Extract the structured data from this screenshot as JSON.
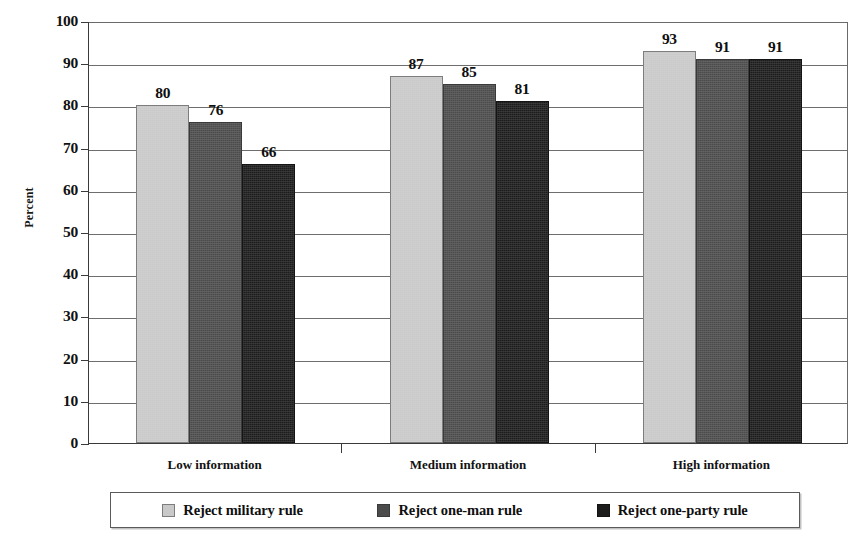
{
  "chart_data": {
    "type": "bar",
    "title": "",
    "xlabel": "",
    "ylabel": "Percent",
    "ylim": [
      0,
      100
    ],
    "ytick_step": 10,
    "yticks": [
      "0",
      "10",
      "20",
      "30",
      "40",
      "50",
      "60",
      "70",
      "80",
      "90",
      "100"
    ],
    "grid": true,
    "legend_position": "bottom",
    "categories": [
      "Low information",
      "Medium information",
      "High information"
    ],
    "series": [
      {
        "name": "Reject military rule",
        "color": "#c9c9c9",
        "values": [
          80,
          87,
          93
        ]
      },
      {
        "name": "Reject one-man rule",
        "color": "#4b4b4b",
        "values": [
          76,
          85,
          91
        ]
      },
      {
        "name": "Reject one-party rule",
        "color": "#1c1c1c",
        "values": [
          66,
          81,
          91
        ]
      }
    ]
  },
  "axis": {
    "y_title": "Percent"
  },
  "legend": {
    "items": [
      {
        "label": "Reject military rule",
        "swatch": "s0"
      },
      {
        "label": "Reject one-man rule",
        "swatch": "s1"
      },
      {
        "label": "Reject one-party rule",
        "swatch": "s2"
      }
    ]
  },
  "colors": {
    "series_light": "#c9c9c9",
    "series_medium": "#4b4b4b",
    "series_dark": "#1c1c1c",
    "axis": "#3a3a3a",
    "gridline": "#6e6e6e",
    "text": "#0f0f0f",
    "background": "#ffffff"
  }
}
